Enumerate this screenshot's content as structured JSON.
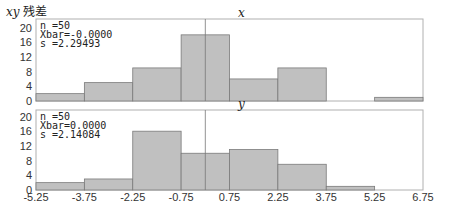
{
  "header": {
    "title_var": "xy",
    "title_text": "残差"
  },
  "colors": {
    "bar_fill": "#c0c0c0",
    "bar_stroke": "#7a7a7a",
    "frame": "#b0b0b0",
    "center_line": "#777777"
  },
  "chart_data": [
    {
      "type": "bar",
      "title": "x",
      "xlabel": "",
      "ylabel": "",
      "bin_edges": [
        -5.25,
        -3.75,
        -2.25,
        -0.75,
        0.75,
        2.25,
        3.75,
        5.25,
        6.75
      ],
      "categories": [
        "-5.25 to -3.75",
        "-3.75 to -2.25",
        "-2.25 to -0.75",
        "-0.75 to 0.75",
        "0.75 to 2.25",
        "2.25 to 3.75",
        "3.75 to 5.25",
        "5.25 to 6.75"
      ],
      "values": [
        2,
        5,
        9,
        18,
        6,
        9,
        0,
        1
      ],
      "ylim": [
        0,
        20
      ],
      "yticks": [
        "20",
        "16",
        "12",
        "8",
        "4",
        "0"
      ],
      "stats": {
        "n": "n    =50",
        "xbar": "Xbar=-0.0000",
        "s": "s    =2.29493"
      },
      "grid": false,
      "reference_line_x": 0
    },
    {
      "type": "bar",
      "title": "y",
      "xlabel": "",
      "ylabel": "",
      "bin_edges": [
        -5.25,
        -3.75,
        -2.25,
        -0.75,
        0.75,
        2.25,
        3.75,
        5.25,
        6.75
      ],
      "categories": [
        "-5.25 to -3.75",
        "-3.75 to -2.25",
        "-2.25 to -0.75",
        "-0.75 to 0.75",
        "0.75 to 2.25",
        "2.25 to 3.75",
        "3.75 to 5.25",
        "5.25 to 6.75"
      ],
      "values": [
        2,
        3,
        16,
        10,
        11,
        7,
        1,
        0
      ],
      "ylim": [
        0,
        20
      ],
      "yticks": [
        "20",
        "16",
        "12",
        "8",
        "4",
        "0"
      ],
      "xticks": [
        "-5.25",
        "-3.75",
        "-2.25",
        "-0.75",
        "0.75",
        "2.25",
        "3.75",
        "5.25",
        "6.75"
      ],
      "stats": {
        "n": "n    =50",
        "xbar": "Xbar=0.0000",
        "s": "s    =2.14084"
      },
      "grid": false,
      "reference_line_x": 0
    }
  ]
}
